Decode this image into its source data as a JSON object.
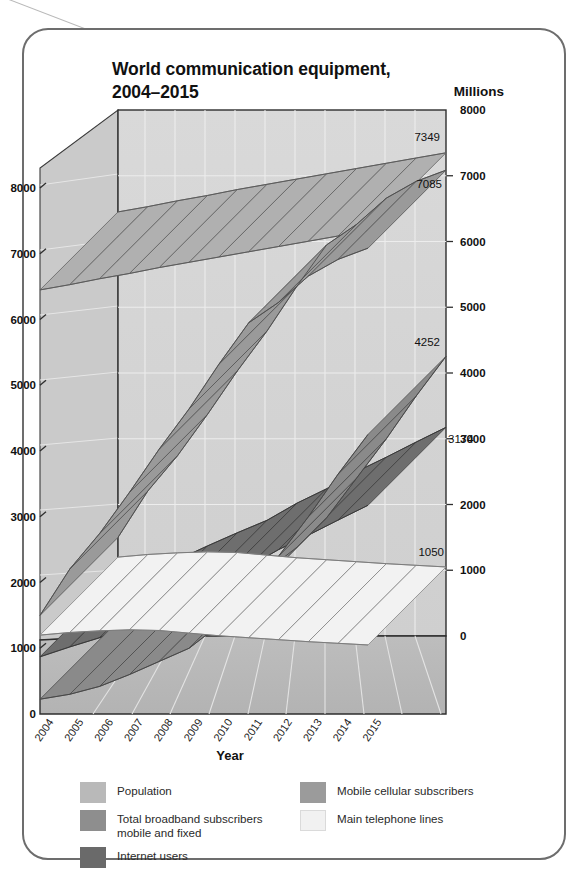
{
  "card": {
    "border_color": "#6d6d6d"
  },
  "chart_data": {
    "type": "line",
    "title": "World communication equipment, 2004–2015",
    "xlabel": "Year",
    "ylabel": "Millions",
    "secondary_axis_label": "Millions",
    "ylim": [
      0,
      8000
    ],
    "left_axis_ticks": [
      "0",
      "1000",
      "2000",
      "3000",
      "4000",
      "5000",
      "6000",
      "7000",
      "8000"
    ],
    "right_axis_ticks": [
      "0",
      "1000",
      "2000",
      "3000",
      "4000",
      "5000",
      "6000",
      "7000",
      "8000"
    ],
    "grid": true,
    "legend_position": "bottom",
    "categories": [
      "2004",
      "2005",
      "2006",
      "2007",
      "2008",
      "2009",
      "2010",
      "2011",
      "2012",
      "2013",
      "2014",
      "2015"
    ],
    "series": [
      {
        "name": "Population",
        "color": "#b0b0b0",
        "end_label": "7349",
        "values": [
          6450,
          6530,
          6620,
          6700,
          6790,
          6870,
          6950,
          7030,
          7110,
          7190,
          7270,
          7349
        ]
      },
      {
        "name": "Mobile cellular subscribers",
        "color": "#9a9a9a",
        "end_label": "7085",
        "values": [
          1500,
          2205,
          2745,
          3370,
          4030,
          4640,
          5320,
          5950,
          6260,
          6660,
          6915,
          7085
        ]
      },
      {
        "name": "Internet users",
        "color": "#6e6e6e",
        "end_label": "3174",
        "values": [
          870,
          1020,
          1160,
          1370,
          1570,
          1760,
          2020,
          2240,
          2500,
          2720,
          2950,
          3174
        ]
      },
      {
        "name": "Total broadband subscribers mobile and fixed",
        "color": "#8a8a8a",
        "end_label": "4252",
        "values": [
          225,
          300,
          420,
          600,
          800,
          1000,
          1350,
          1800,
          2400,
          3000,
          3650,
          4252
        ]
      },
      {
        "name": "Main telephone lines",
        "color": "#f2f2f2",
        "end_label": "1050",
        "values": [
          1200,
          1240,
          1265,
          1280,
          1270,
          1230,
          1190,
          1160,
          1130,
          1100,
          1075,
          1050
        ]
      }
    ]
  },
  "legend": {
    "left": [
      {
        "label": "Population",
        "color": "#b9b9b9"
      },
      {
        "label": "Total broadband subscribers\nmobile and fixed",
        "color": "#8e8e8e"
      },
      {
        "label": "Internet users",
        "color": "#6a6a6a"
      }
    ],
    "right": [
      {
        "label": "Mobile cellular subscribers",
        "color": "#9b9b9b"
      },
      {
        "label": "Main telephone lines",
        "color": "#f1f1f1"
      }
    ]
  }
}
